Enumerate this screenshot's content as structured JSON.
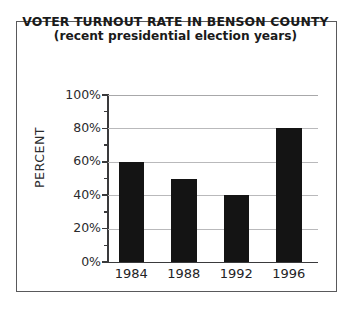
{
  "chart_data": {
    "type": "bar",
    "title": "VOTER TURNOUT RATE IN BENSON COUNTY",
    "subtitle": "(recent presidential election years)",
    "xlabel": "",
    "ylabel": "PERCENT",
    "categories": [
      "1984",
      "1988",
      "1992",
      "1996"
    ],
    "values": [
      60,
      50,
      40,
      80
    ],
    "value_labels": [
      "60%",
      "50%",
      "40%",
      "80%"
    ],
    "ylim": [
      0,
      100
    ],
    "ytick_values": [
      0,
      20,
      40,
      60,
      80,
      100
    ],
    "ytick_labels": [
      "0%",
      "20%",
      "40%",
      "60%",
      "80%",
      "100%"
    ],
    "yminor_tick_values": [
      10,
      30,
      50,
      70,
      90
    ],
    "grid": "horizontal",
    "legend": "none",
    "bar_color": "#141414",
    "gridline_color": "#b9b9bb",
    "axis_color": "#3a3a3c",
    "frame_color": "#59595b",
    "background_color": "#ffffff",
    "text_color": "#232325"
  }
}
